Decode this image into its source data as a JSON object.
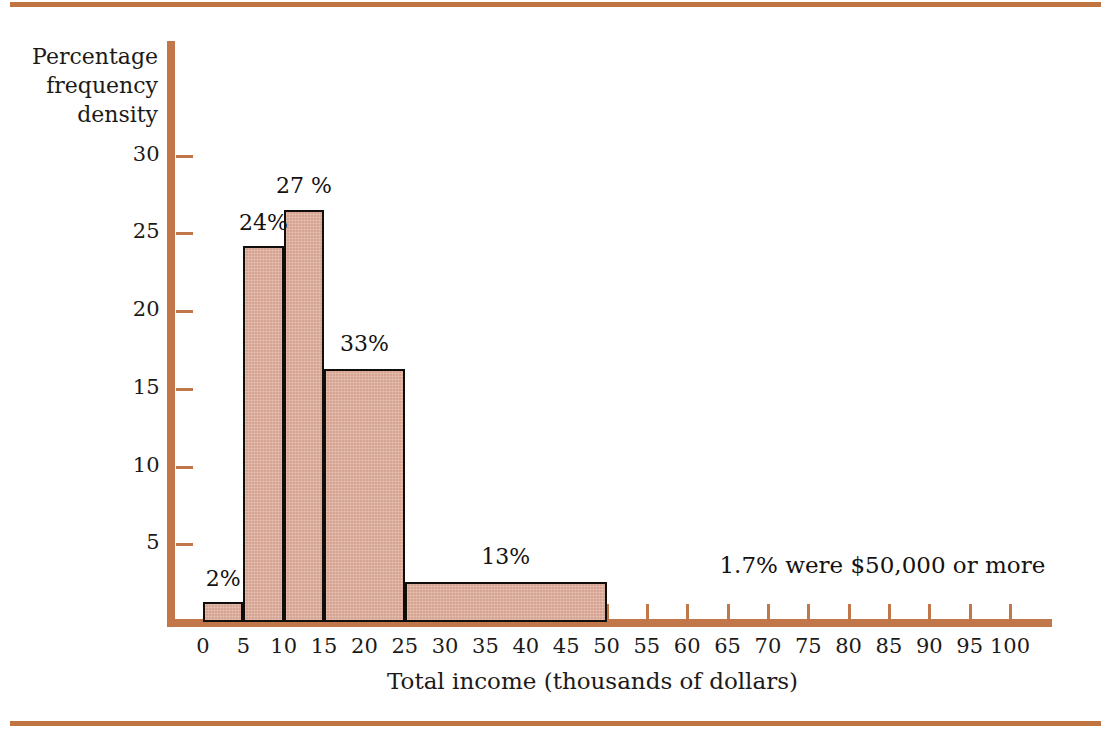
{
  "chart_data": {
    "type": "bar",
    "title": "",
    "subtitle": "",
    "xlabel": "Total income (thousands of dollars)",
    "ylabel": "Percentage frequency density",
    "ylabel_lines": [
      "Percentage",
      "frequency",
      "density"
    ],
    "xlim": [
      0,
      103
    ],
    "ylim": [
      0,
      31
    ],
    "grid": false,
    "legend": null,
    "x_ticks": [
      0,
      5,
      10,
      15,
      20,
      25,
      30,
      35,
      40,
      45,
      50,
      55,
      60,
      65,
      70,
      75,
      80,
      85,
      90,
      95,
      100
    ],
    "x_tick_labels": [
      "0",
      "5",
      "10",
      "15",
      "20",
      "25",
      "30",
      "35",
      "40",
      "45",
      "50",
      "55",
      "60",
      "65",
      "70",
      "75",
      "80",
      "85",
      "90",
      "95",
      "100"
    ],
    "y_ticks": [
      5,
      10,
      15,
      20,
      25,
      30
    ],
    "y_tick_labels": [
      "5",
      "10",
      "15",
      "20",
      "25",
      "30"
    ],
    "bins": [
      {
        "x_start": 0,
        "x_end": 5,
        "density": 1.3,
        "label": "2%",
        "label_x": 2.5,
        "label_y": 2.7
      },
      {
        "x_start": 5,
        "x_end": 10,
        "density": 24.2,
        "label": "24%",
        "label_x": 7.5,
        "label_y": 25.6
      },
      {
        "x_start": 10,
        "x_end": 15,
        "density": 26.5,
        "label": "27 %",
        "label_x": 12.5,
        "label_y": 28.0
      },
      {
        "x_start": 15,
        "x_end": 25,
        "density": 16.3,
        "label": "33%",
        "label_x": 20.0,
        "label_y": 17.8
      },
      {
        "x_start": 25,
        "x_end": 50,
        "density": 2.6,
        "label": "13%",
        "label_x": 37.5,
        "label_y": 4.1
      }
    ],
    "annotations": [
      {
        "text": "1.7% were $50,000 or more",
        "x": 64,
        "y": 3.6
      }
    ],
    "colors": {
      "bar_fill": "#d7a491",
      "bar_edge": "#100d0b",
      "axis": "#c2774a",
      "text": "#15110f",
      "background": "#ffffff",
      "rule": "#c0743f"
    }
  }
}
